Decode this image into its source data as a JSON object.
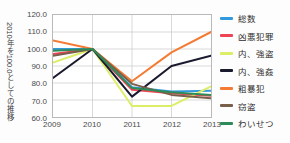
{
  "chart_data": {
    "type": "line",
    "title": "",
    "ylabel": "2010年を100.0としての推移",
    "xlabel": "",
    "categories": [
      "2009",
      "2010",
      "2011",
      "2012",
      "2013"
    ],
    "x": [
      2009,
      2010,
      2011,
      2012,
      2013
    ],
    "ylim": [
      60.0,
      120.0
    ],
    "yticks": [
      "120.0",
      "110.0",
      "100.0",
      "90.0",
      "80.0",
      "70.0",
      "60.0"
    ],
    "ytick_values": [
      120.0,
      110.0,
      100.0,
      90.0,
      80.0,
      70.0,
      60.0
    ],
    "grid": true,
    "legend_position": "right",
    "series": [
      {
        "name": "総数",
        "color": "#3399dd",
        "values": [
          100.0,
          100.0,
          77.5,
          75.0,
          75.5
        ]
      },
      {
        "name": "凶悪犯罪",
        "color": "#ee4455",
        "values": [
          97.0,
          100.0,
          76.0,
          74.0,
          72.5
        ]
      },
      {
        "name": "内、強盗",
        "color": "#ddee66",
        "values": [
          92.0,
          100.0,
          66.5,
          66.5,
          78.0
        ]
      },
      {
        "name": "内、強姦",
        "color": "#1a1a2e",
        "values": [
          83.0,
          100.0,
          72.0,
          90.0,
          96.0
        ]
      },
      {
        "name": "粗暴犯",
        "color": "#f47b34",
        "values": [
          105.0,
          100.0,
          81.0,
          98.0,
          110.0
        ]
      },
      {
        "name": "窃盗",
        "color": "#7a5f4a",
        "values": [
          96.0,
          100.0,
          79.5,
          73.0,
          71.0
        ]
      },
      {
        "name": "わいせつ",
        "color": "#2e8b57",
        "values": [
          99.0,
          100.0,
          77.0,
          74.5,
          73.0
        ]
      }
    ]
  },
  "axis": {
    "y_title": "2010年を100.0としての推移",
    "y_ticks": [
      "120.0",
      "110.0",
      "100.0",
      "90.0",
      "80.0",
      "70.0",
      "60.0"
    ],
    "x_ticks": [
      "2009",
      "2010",
      "2011",
      "2012",
      "2013"
    ]
  },
  "legend": {
    "items": [
      {
        "label": "総数",
        "color": "#3399dd"
      },
      {
        "label": "凶悪犯罪",
        "color": "#ee4455"
      },
      {
        "label": "内、強盗",
        "color": "#ddee66"
      },
      {
        "label": "内、強姦",
        "color": "#1a1a2e"
      },
      {
        "label": "粗暴犯",
        "color": "#f47b34"
      },
      {
        "label": "窃盗",
        "color": "#7a5f4a"
      },
      {
        "label": "わいせつ",
        "color": "#2e8b57"
      }
    ]
  },
  "colors": {
    "grid": "#c9c9c9",
    "frame": "#b9b9b9",
    "text": "#3a3a3a",
    "background": "#ffffff"
  }
}
